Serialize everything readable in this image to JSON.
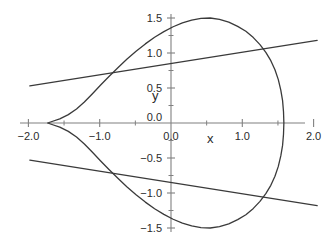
{
  "chart_data": {
    "type": "line",
    "title": "",
    "subtitle": "",
    "xlabel": "x",
    "ylabel": "y",
    "xlim": [
      -2.0,
      2.0
    ],
    "ylim": [
      -1.5,
      1.5
    ],
    "grid": false,
    "legend": "none",
    "background_color": "#ffffff",
    "curve_color": "#3a3a3a",
    "axis_color": "#808080",
    "text_color": "#2b2b2b",
    "xticks": [
      -2.0,
      -1.0,
      0.0,
      1.0,
      2.0
    ],
    "xtick_labels": [
      "-2.0",
      "-1.0",
      "0.0",
      "1.0",
      "2.0"
    ],
    "xminor_ticks": [
      -1.5,
      -0.5,
      0.5,
      1.5
    ],
    "yticks": [
      -1.5,
      -1.0,
      -0.5,
      0.0,
      0.5,
      1.0,
      1.5
    ],
    "ytick_labels": [
      "-1.5",
      "-1.0",
      "-0.5",
      "0.0",
      "0.5",
      "1.0",
      "1.5"
    ],
    "yminor_ticks": [
      -1.25,
      -0.75,
      -0.25,
      0.25,
      0.75,
      1.25
    ],
    "series": [
      {
        "name": "closed-curve",
        "type": "closed-curve",
        "color": "#3a3a3a",
        "width": 1.3,
        "closed": true,
        "points": [
          [
            1.583,
            0.0
          ],
          [
            1.578,
            0.16
          ],
          [
            1.565,
            0.32
          ],
          [
            1.54,
            0.47
          ],
          [
            1.505,
            0.62
          ],
          [
            1.458,
            0.76
          ],
          [
            1.4,
            0.89
          ],
          [
            1.33,
            1.01
          ],
          [
            1.248,
            1.12
          ],
          [
            1.155,
            1.22
          ],
          [
            1.05,
            1.31
          ],
          [
            0.935,
            1.38
          ],
          [
            0.81,
            1.44
          ],
          [
            0.68,
            1.48
          ],
          [
            0.55,
            1.5
          ],
          [
            0.42,
            1.495
          ],
          [
            0.29,
            1.47
          ],
          [
            0.16,
            1.43
          ],
          [
            0.03,
            1.375
          ],
          [
            -0.1,
            1.305
          ],
          [
            -0.23,
            1.225
          ],
          [
            -0.36,
            1.13
          ],
          [
            -0.49,
            1.025
          ],
          [
            -0.62,
            0.91
          ],
          [
            -0.745,
            0.79
          ],
          [
            -0.87,
            0.665
          ],
          [
            -0.99,
            0.54
          ],
          [
            -1.105,
            0.415
          ],
          [
            -1.215,
            0.3
          ],
          [
            -1.325,
            0.2
          ],
          [
            -1.44,
            0.12
          ],
          [
            -1.56,
            0.06
          ],
          [
            -1.68,
            0.018
          ],
          [
            -1.73,
            0.0
          ],
          [
            -1.68,
            -0.018
          ],
          [
            -1.56,
            -0.06
          ],
          [
            -1.44,
            -0.12
          ],
          [
            -1.325,
            -0.2
          ],
          [
            -1.215,
            -0.3
          ],
          [
            -1.105,
            -0.415
          ],
          [
            -0.99,
            -0.54
          ],
          [
            -0.87,
            -0.665
          ],
          [
            -0.745,
            -0.79
          ],
          [
            -0.62,
            -0.91
          ],
          [
            -0.49,
            -1.025
          ],
          [
            -0.36,
            -1.13
          ],
          [
            -0.23,
            -1.225
          ],
          [
            -0.1,
            -1.305
          ],
          [
            0.03,
            -1.375
          ],
          [
            0.16,
            -1.43
          ],
          [
            0.29,
            -1.47
          ],
          [
            0.42,
            -1.495
          ],
          [
            0.55,
            -1.5
          ],
          [
            0.68,
            -1.48
          ],
          [
            0.81,
            -1.44
          ],
          [
            0.935,
            -1.38
          ],
          [
            1.05,
            -1.31
          ],
          [
            1.155,
            -1.22
          ],
          [
            1.248,
            -1.12
          ],
          [
            1.33,
            -1.01
          ],
          [
            1.4,
            -0.89
          ],
          [
            1.458,
            -0.76
          ],
          [
            1.505,
            -0.62
          ],
          [
            1.54,
            -0.47
          ],
          [
            1.565,
            -0.32
          ],
          [
            1.578,
            -0.16
          ],
          [
            1.583,
            0.0
          ]
        ]
      },
      {
        "name": "upper-line",
        "type": "line",
        "color": "#3a3a3a",
        "width": 1.3,
        "points": [
          [
            -1.98,
            0.53
          ],
          [
            2.05,
            1.18
          ]
        ]
      },
      {
        "name": "lower-line",
        "type": "line",
        "color": "#3a3a3a",
        "width": 1.3,
        "points": [
          [
            -1.98,
            -0.53
          ],
          [
            2.05,
            -1.18
          ]
        ]
      }
    ],
    "annotations": [
      {
        "text": "y",
        "x": -0.22,
        "y": 0.33
      },
      {
        "text": "x",
        "x": 0.55,
        "y": -0.28
      }
    ]
  }
}
